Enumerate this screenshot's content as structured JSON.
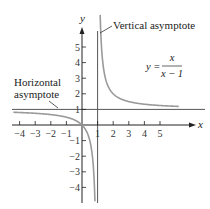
{
  "chart_data": {
    "type": "line",
    "title": "",
    "function": "y = x/(x - 1)",
    "formula": {
      "lhs": "y =",
      "numerator": "x",
      "denominator": "x − 1"
    },
    "xlabel": "x",
    "ylabel": "y",
    "xlim": [
      -4.5,
      7
    ],
    "ylim": [
      -4.5,
      6
    ],
    "x_ticks": [
      -4,
      -3,
      -2,
      -1,
      1,
      2,
      3,
      4,
      5
    ],
    "x_tick_labels": [
      "−4",
      "−3",
      "−2",
      "−1",
      "1",
      "2",
      "3",
      "4",
      "5"
    ],
    "y_ticks": [
      -4,
      -3,
      -2,
      -1,
      1,
      2,
      3,
      4,
      5
    ],
    "y_tick_labels": [
      "−4",
      "−3",
      "−2",
      "−1",
      "1",
      "2",
      "3",
      "4",
      "5"
    ],
    "grid": false,
    "asymptotes": {
      "horizontal": {
        "y": 1,
        "label": [
          "Horizontal",
          "asymptote"
        ]
      },
      "vertical": {
        "x": 1,
        "label": "Vertical asymptote"
      }
    },
    "series": [
      {
        "name": "left branch",
        "x": [
          -4.3,
          -4,
          -3,
          -2,
          -1,
          -0.5,
          0,
          0.5,
          0.7,
          0.8
        ],
        "y": [
          0.81,
          0.8,
          0.75,
          0.667,
          0.5,
          0.333,
          0,
          -1,
          -2.333,
          -4
        ]
      },
      {
        "name": "right branch",
        "x": [
          1.17,
          1.2,
          1.25,
          1.5,
          2,
          3,
          4,
          5,
          6.2
        ],
        "y": [
          6.0,
          6,
          5,
          3,
          2,
          1.5,
          1.333,
          1.25,
          1.19
        ]
      }
    ],
    "colors": {
      "curve": "#9a9a9a",
      "axes": "#222222",
      "asymptote": "#555555"
    }
  }
}
